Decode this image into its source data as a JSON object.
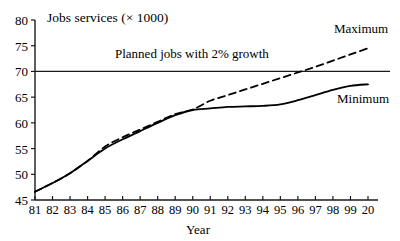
{
  "chart_data": {
    "type": "line",
    "title": "Jobs services (× 1000)",
    "xlabel": "Year",
    "ylabel": "",
    "xlim": [
      1981,
      2000
    ],
    "ylim": [
      45,
      80
    ],
    "grid": false,
    "legend_position": "inline-right",
    "x": [
      1981,
      1982,
      1983,
      1984,
      1985,
      1986,
      1987,
      1988,
      1989,
      1990,
      1991,
      1992,
      1993,
      1994,
      1995,
      1996,
      1997,
      1998,
      1999,
      2000
    ],
    "xtick_labels": [
      "81",
      "82",
      "83",
      "84",
      "85",
      "86",
      "87",
      "88",
      "89",
      "90",
      "91",
      "92",
      "93",
      "94",
      "95",
      "96",
      "97",
      "98",
      "99",
      "20"
    ],
    "ytick_labels": [
      "45",
      "50",
      "55",
      "60",
      "65",
      "70",
      "75",
      "80"
    ],
    "ytick_values": [
      45,
      50,
      55,
      60,
      65,
      70,
      75,
      80
    ],
    "series": [
      {
        "name": "Minimum",
        "style": "solid",
        "label": "Minimum",
        "color": "#000000",
        "values": [
          46.6,
          48.3,
          50.2,
          52.6,
          55.0,
          56.8,
          58.4,
          60.0,
          61.5,
          62.5,
          62.8,
          63.1,
          63.2,
          63.3,
          63.6,
          64.4,
          65.4,
          66.4,
          67.2,
          67.5
        ]
      },
      {
        "name": "Maximum",
        "style": "dashed",
        "label": "Maximum",
        "color": "#000000",
        "values": [
          46.6,
          48.3,
          50.2,
          52.6,
          55.4,
          57.2,
          58.7,
          60.2,
          61.7,
          62.6,
          64.3,
          65.4,
          66.5,
          67.6,
          68.7,
          69.8,
          70.9,
          72.1,
          73.3,
          74.5
        ]
      }
    ],
    "reference_lines": [
      {
        "name": "planned-jobs-line",
        "label": "Planned jobs with 2% growth",
        "orientation": "horizontal",
        "value": 70,
        "color": "#000000"
      }
    ]
  },
  "labels": {
    "title": "Jobs services (× 1000)",
    "xaxis_title": "Year",
    "annotation": "Planned jobs with 2% growth",
    "series_max": "Maximum",
    "series_min": "Minimum"
  }
}
